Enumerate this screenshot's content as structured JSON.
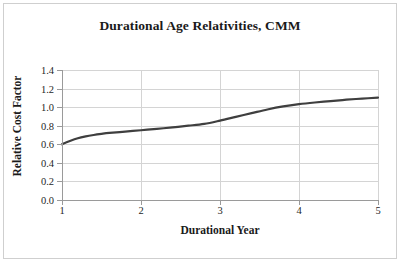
{
  "chart_data": {
    "type": "line",
    "title": "Durational Age Relativities, CMM",
    "xlabel": "Durational Year",
    "ylabel": "Relative Cost Factor",
    "xlim": [
      1,
      5
    ],
    "ylim": [
      0.0,
      1.4
    ],
    "grid": true,
    "legend": null,
    "xticks": [
      "1",
      "2",
      "3",
      "4",
      "5"
    ],
    "xtick_values": [
      1,
      2,
      3,
      4,
      5
    ],
    "yticks": [
      "0.0",
      "0.2",
      "0.4",
      "0.6",
      "0.8",
      "1.0",
      "1.2",
      "1.4"
    ],
    "ytick_values": [
      0.0,
      0.2,
      0.4,
      0.6,
      0.8,
      1.0,
      1.2,
      1.4
    ],
    "series": [
      {
        "name": "Relative Cost Factor",
        "color": "#3f3f3f",
        "x": [
          1.0,
          1.1,
          1.2,
          1.3,
          1.4,
          1.5,
          1.6,
          1.8,
          2.0,
          2.2,
          2.4,
          2.6,
          2.8,
          3.0,
          3.2,
          3.4,
          3.6,
          3.8,
          4.0,
          4.2,
          4.4,
          4.6,
          4.8,
          5.0
        ],
        "values": [
          0.6,
          0.635,
          0.665,
          0.685,
          0.7,
          0.712,
          0.722,
          0.737,
          0.751,
          0.766,
          0.782,
          0.8,
          0.82,
          0.855,
          0.895,
          0.935,
          0.975,
          1.008,
          1.032,
          1.05,
          1.065,
          1.08,
          1.092,
          1.102
        ]
      }
    ]
  },
  "axes": {
    "title": "Durational Age Relativities, CMM",
    "x_axis_title": "Durational Year",
    "y_axis_title": "Relative Cost Factor"
  },
  "colors": {
    "line": "#3f3f3f",
    "grid": "#d4d4d4",
    "axis": "#9a9a9a",
    "text": "#1a1a1a",
    "border": "#cfcfcf",
    "background": "#ffffff"
  }
}
